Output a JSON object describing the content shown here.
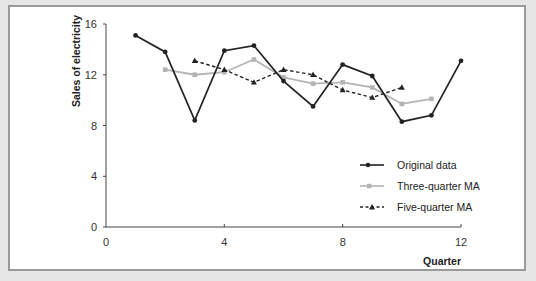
{
  "chart_data": {
    "type": "line",
    "title": "",
    "xlabel": "Quarter",
    "ylabel": "Sales of electricity",
    "xlim": [
      0,
      12
    ],
    "ylim": [
      0,
      16
    ],
    "xticks": [
      0,
      4,
      8,
      12
    ],
    "yticks": [
      0,
      4,
      8,
      12,
      16
    ],
    "grid": false,
    "legend_position": "lower right",
    "series": [
      {
        "name": "Original data",
        "style": "solid black, circle markers",
        "color": "#222222",
        "x": [
          1,
          2,
          3,
          4,
          5,
          6,
          7,
          8,
          9,
          10,
          11,
          12
        ],
        "values": [
          15.1,
          13.8,
          8.4,
          13.9,
          14.3,
          11.5,
          9.5,
          12.8,
          11.9,
          8.3,
          8.8,
          13.1
        ]
      },
      {
        "name": "Three-quarter MA",
        "style": "solid light gray, square markers",
        "color": "#b4b4b4",
        "x": [
          2,
          3,
          4,
          5,
          6,
          7,
          8,
          9,
          10,
          11
        ],
        "values": [
          12.4,
          12.0,
          12.2,
          13.2,
          11.8,
          11.3,
          11.4,
          11.0,
          9.7,
          10.1
        ]
      },
      {
        "name": "Five-quarter MA",
        "style": "dashed black, triangle markers",
        "color": "#222222",
        "x": [
          3,
          4,
          5,
          6,
          7,
          8,
          9,
          10
        ],
        "values": [
          13.1,
          12.4,
          11.4,
          12.4,
          12.0,
          10.8,
          10.2,
          11.0
        ]
      }
    ]
  },
  "labels": {
    "y_axis": "Sales of electricity",
    "x_axis": "Quarter",
    "xtick_0": "0",
    "xtick_4": "4",
    "xtick_8": "8",
    "xtick_12": "12",
    "ytick_0": "0",
    "ytick_4": "4",
    "ytick_8": "8",
    "ytick_12": "12",
    "ytick_16": "16",
    "legend_original": "Original data",
    "legend_three": "Three-quarter MA",
    "legend_five": "Five-quarter MA"
  }
}
